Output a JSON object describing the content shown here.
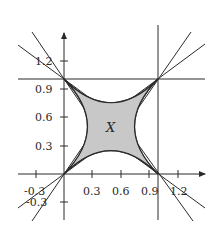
{
  "figure": {
    "region_label": "X",
    "x_ticks": [
      "-0.3",
      "0.3",
      "0.6",
      "0.9",
      "1.2"
    ],
    "y_ticks": [
      "-0.3",
      "0.3",
      "0.6",
      "0.9",
      "1.2"
    ],
    "colors": {
      "fill": "#c8c8c8",
      "stroke": "#2a2a2a",
      "background": "#ffffff"
    }
  }
}
